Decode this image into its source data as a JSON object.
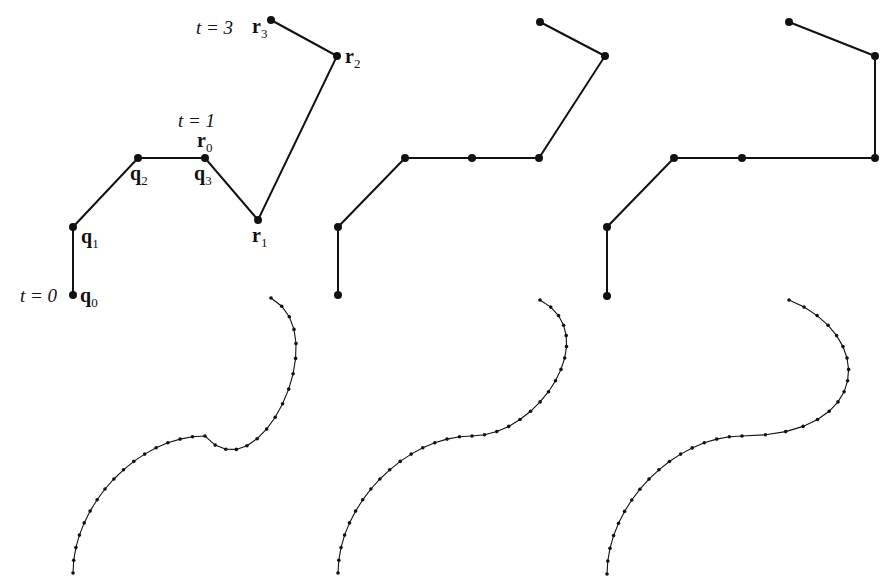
{
  "figure": {
    "panels": [
      {
        "id": "panel-1",
        "control_points": [
          [
            73,
            295
          ],
          [
            73,
            227
          ],
          [
            138,
            158
          ],
          [
            205,
            158
          ],
          [
            205,
            158
          ],
          [
            258,
            220
          ],
          [
            337,
            56
          ],
          [
            271,
            20
          ]
        ],
        "curve_offset_y": 278
      },
      {
        "id": "panel-2",
        "control_points": [
          [
            338,
            295
          ],
          [
            338,
            227
          ],
          [
            405,
            158
          ],
          [
            472,
            158
          ],
          [
            472,
            158
          ],
          [
            539,
            158
          ],
          [
            605,
            56
          ],
          [
            540,
            22
          ]
        ],
        "curve_offset_y": 278
      },
      {
        "id": "panel-3",
        "control_points": [
          [
            607,
            296
          ],
          [
            607,
            227
          ],
          [
            674,
            158
          ],
          [
            742,
            158
          ],
          [
            742,
            158
          ],
          [
            875,
            158
          ],
          [
            875,
            56
          ],
          [
            789,
            22
          ]
        ],
        "curve_offset_y": 278
      }
    ]
  },
  "labels": {
    "t0": "t = 0",
    "t1": "t = 1",
    "t3": "t = 3",
    "q0": "q",
    "q0_sub": "0",
    "q1": "q",
    "q1_sub": "1",
    "q2": "q",
    "q2_sub": "2",
    "q3": "q",
    "q3_sub": "3",
    "r0": "r",
    "r0_sub": "0",
    "r1": "r",
    "r1_sub": "1",
    "r2": "r",
    "r2_sub": "2",
    "r3": "r",
    "r3_sub": "3"
  },
  "colors": {
    "ink": "#111111",
    "background": "#ffffff"
  }
}
